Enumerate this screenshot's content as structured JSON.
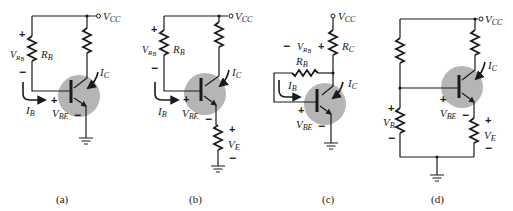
{
  "figure": {
    "colors": {
      "ink": "#1a1a1a",
      "transistor_shade": "#b5b5b5",
      "background": "#ffffff"
    },
    "panels": [
      {
        "id": "a",
        "caption": "(a)",
        "supply": "V",
        "supply_sub": "CC",
        "labels": {
          "vrb": "V",
          "vrb_sub": "R",
          "vrb_subsub": "B",
          "rb": "R",
          "rb_sub": "B",
          "ic": "I",
          "ic_sub": "C",
          "ib": "I",
          "ib_sub": "B",
          "vbe": "V",
          "vbe_sub": "BE"
        },
        "polarity": {
          "vrb_top": "+",
          "vrb_bottom": "−",
          "vbe_plus": "+",
          "vbe_minus": "−"
        }
      },
      {
        "id": "b",
        "caption": "(b)",
        "supply": "V",
        "supply_sub": "CC",
        "labels": {
          "vrb": "V",
          "vrb_sub": "R",
          "vrb_subsub": "B",
          "rb": "R",
          "rb_sub": "B",
          "ic": "I",
          "ic_sub": "C",
          "ib": "I",
          "ib_sub": "B",
          "vbe": "V",
          "vbe_sub": "BE",
          "ve": "V",
          "ve_sub": "E"
        },
        "polarity": {
          "vrb_top": "+",
          "vrb_bottom": "−",
          "vbe_plus": "+",
          "vbe_minus": "−",
          "ve_top": "+",
          "ve_bottom": "−"
        }
      },
      {
        "id": "c",
        "caption": "(c)",
        "supply": "V",
        "supply_sub": "CC",
        "labels": {
          "vrb": "V",
          "vrb_sub": "R",
          "vrb_subsub": "B",
          "rc": "R",
          "rc_sub": "C",
          "rb": "R",
          "rb_sub": "B",
          "ic": "I",
          "ic_sub": "C",
          "ib": "I",
          "ib_sub": "B",
          "vbe": "V",
          "vbe_sub": "BE"
        },
        "polarity": {
          "vrb_left": "−",
          "vrb_right": "+",
          "vbe_plus": "+",
          "vbe_minus": "−"
        }
      },
      {
        "id": "d",
        "caption": "(d)",
        "supply": "V",
        "supply_sub": "CC",
        "labels": {
          "vb": "V",
          "vb_sub": "B",
          "ic": "I",
          "ic_sub": "C",
          "vbe": "V",
          "vbe_sub": "BE",
          "ve": "V",
          "ve_sub": "E"
        },
        "polarity": {
          "vb_top": "+",
          "vb_bottom": "−",
          "vbe_plus": "+",
          "vbe_minus": "−",
          "ve_top": "+",
          "ve_bottom": "−"
        }
      }
    ]
  }
}
